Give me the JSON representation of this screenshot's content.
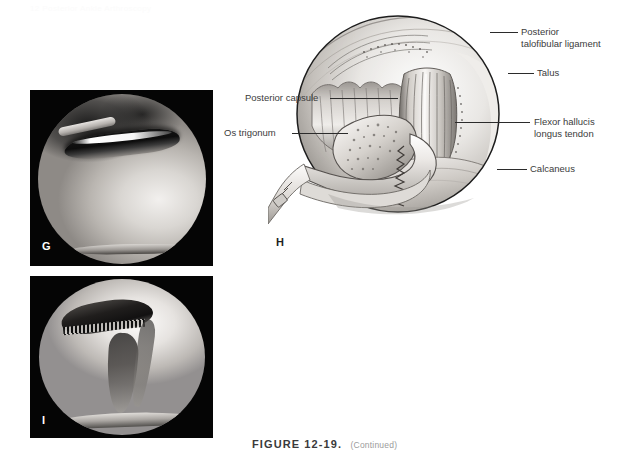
{
  "page": {
    "running_head": "12   Posterior Ankle Arthroscopy"
  },
  "figure": {
    "label": "FIGURE 12-19.",
    "continued_note": "(Continued)"
  },
  "panels": [
    {
      "id": "G",
      "letter": "G",
      "type": "arthroscopic-photograph",
      "description": "Arthroscopic view of posterior ankle showing os trigonum and surrounding tissue"
    },
    {
      "id": "H",
      "letter": "H",
      "type": "line-art-illustration",
      "description": "Illustration of posterior ankle arthroscopy with grasper removing os trigonum"
    },
    {
      "id": "I",
      "letter": "I",
      "type": "arthroscopic-photograph",
      "description": "Arthroscopic view after os trigonum excision"
    }
  ],
  "illustration_labels": {
    "posterior_talofibular_ligament": {
      "line1": "Posterior",
      "line2": "talofibular ligament"
    },
    "talus": "Talus",
    "flexor_hallucis_longus_tendon": {
      "line1": "Flexor hallucis",
      "line2": "longus tendon"
    },
    "calcaneus": "Calcaneus",
    "posterior_capsule": "Posterior capsule",
    "os_trigonum": "Os trigonum"
  },
  "colors": {
    "label_text": "#3b3b3b",
    "leader_line": "#2b2b2b",
    "caption_label": "#3a3a3a",
    "caption_note": "#9b9b9b",
    "photo_background": "#050505",
    "page_background": "#ffffff"
  }
}
